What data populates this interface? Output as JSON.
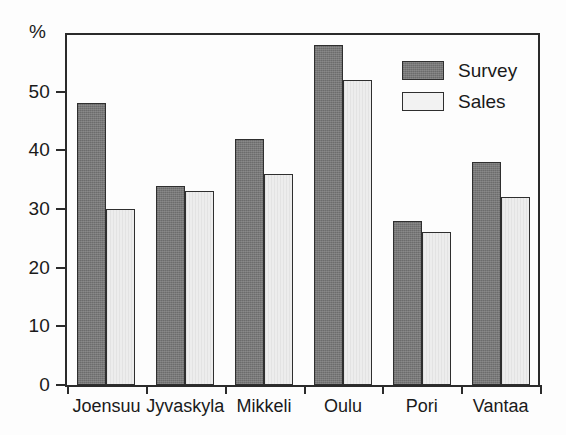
{
  "chart_data": {
    "type": "bar",
    "title": "",
    "xlabel": "",
    "ylabel": "%",
    "ylim": [
      0,
      60
    ],
    "grid": false,
    "legend_position": "top-right",
    "categories": [
      "Joensuu",
      "Jyvaskyla",
      "Mikkeli",
      "Oulu",
      "Pori",
      "Vantaa"
    ],
    "ytick_labels": [
      "0",
      "10",
      "20",
      "30",
      "40",
      "50"
    ],
    "ytick_values": [
      0,
      10,
      20,
      30,
      40,
      50
    ],
    "series": [
      {
        "name": "Survey",
        "color": "#787878",
        "values": [
          48,
          34,
          42,
          58,
          28,
          38
        ]
      },
      {
        "name": "Sales",
        "color": "#ededed",
        "values": [
          30,
          33,
          36,
          52,
          26,
          32
        ]
      }
    ]
  },
  "axis": {
    "unit_label": "%"
  },
  "legend": {
    "items": [
      {
        "label": "Survey"
      },
      {
        "label": "Sales"
      }
    ]
  }
}
